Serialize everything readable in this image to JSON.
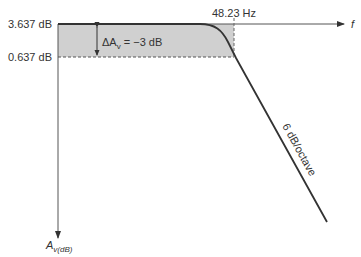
{
  "diagram": {
    "type": "low-pass frequency response (Bode plot)",
    "y_axis": {
      "label_main": "A",
      "label_sub": "v(dB)",
      "ticks": [
        {
          "label": "3.637 dB"
        },
        {
          "label": "0.637 dB"
        }
      ]
    },
    "x_axis": {
      "label": "f",
      "cutoff_label": "48.23 Hz"
    },
    "delta_annotation": {
      "prefix": "ΔA",
      "sub": "v",
      "suffix": " = −3 dB"
    },
    "slope_label": "6 dB/octave",
    "colors": {
      "shade": "#d0d0d0",
      "line": "#333333",
      "axis": "#555555"
    }
  }
}
